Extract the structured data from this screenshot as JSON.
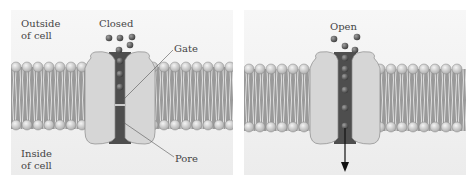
{
  "panels": [
    {
      "id": "closed",
      "title": "Closed",
      "labels": {
        "outside": [
          "Outside",
          "of cell"
        ],
        "inside": [
          "Inside",
          "of cell"
        ],
        "gate": "Gate",
        "pore": "Pore"
      }
    },
    {
      "id": "open",
      "title": "Open"
    }
  ],
  "colors": {
    "background": "#f2f2f2",
    "channel_protein": "#d8d8d8",
    "pore": "#555555",
    "lipid_head": "#d0d0d0",
    "lipid_tail": "#8a8a8a",
    "ion": "#5a5a5a"
  }
}
